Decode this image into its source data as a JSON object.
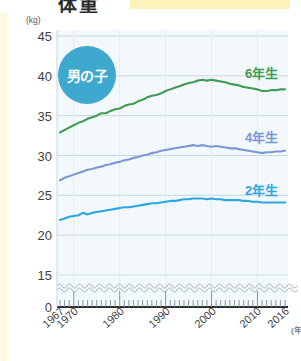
{
  "header": {
    "title_fragment": "体重",
    "highlight_present": true
  },
  "badge": {
    "label": "男の子",
    "color": "#3fa8ce"
  },
  "chart_data": {
    "type": "line",
    "xlabel": "(年)",
    "ylabel": "(kg)",
    "yunit": "(kg)",
    "xunit": "(年)",
    "grid": true,
    "legend_position": "inline-right",
    "axis_break": {
      "present": true,
      "between": [
        0,
        15
      ],
      "style": "wavy"
    },
    "ylim": [
      15,
      45
    ],
    "yticks": [
      0,
      15,
      20,
      25,
      30,
      35,
      40,
      45
    ],
    "xlim": [
      1967,
      2016
    ],
    "xticks": [
      1967,
      1970,
      1980,
      1990,
      2000,
      2010,
      2016
    ],
    "xtick_labels": [
      "1967",
      "1970",
      "1980",
      "1990",
      "2000",
      "2010",
      "2016"
    ],
    "x": [
      1967,
      1968,
      1969,
      1970,
      1971,
      1972,
      1973,
      1974,
      1975,
      1976,
      1977,
      1978,
      1979,
      1980,
      1981,
      1982,
      1983,
      1984,
      1985,
      1986,
      1987,
      1988,
      1989,
      1990,
      1991,
      1992,
      1993,
      1994,
      1995,
      1996,
      1997,
      1998,
      1999,
      2000,
      2001,
      2002,
      2003,
      2004,
      2005,
      2006,
      2007,
      2008,
      2009,
      2010,
      2011,
      2012,
      2013,
      2014,
      2015,
      2016
    ],
    "series": [
      {
        "name": "6年生",
        "label": "6年生",
        "color": "#3f9c52",
        "values": [
          32.9,
          33.2,
          33.5,
          33.8,
          34.1,
          34.3,
          34.6,
          34.8,
          35.0,
          35.3,
          35.3,
          35.6,
          35.8,
          35.9,
          36.2,
          36.4,
          36.5,
          36.8,
          37.0,
          37.3,
          37.5,
          37.6,
          37.8,
          38.1,
          38.3,
          38.5,
          38.7,
          38.9,
          39.1,
          39.2,
          39.4,
          39.5,
          39.4,
          39.5,
          39.4,
          39.3,
          39.2,
          39.0,
          38.9,
          38.8,
          38.6,
          38.5,
          38.4,
          38.3,
          38.1,
          38.1,
          38.2,
          38.2,
          38.3,
          38.3
        ]
      },
      {
        "name": "4年生",
        "label": "4年生",
        "color": "#7b96d4",
        "values": [
          26.9,
          27.2,
          27.4,
          27.6,
          27.8,
          28.0,
          28.2,
          28.3,
          28.5,
          28.6,
          28.8,
          28.9,
          29.1,
          29.2,
          29.4,
          29.5,
          29.7,
          29.8,
          30.0,
          30.1,
          30.3,
          30.4,
          30.6,
          30.7,
          30.8,
          30.9,
          31.0,
          31.1,
          31.2,
          31.3,
          31.2,
          31.3,
          31.2,
          31.1,
          31.2,
          31.1,
          31.0,
          30.9,
          30.9,
          30.8,
          30.7,
          30.6,
          30.5,
          30.4,
          30.3,
          30.4,
          30.4,
          30.5,
          30.5,
          30.6
        ]
      },
      {
        "name": "2年生",
        "label": "2年生",
        "color": "#2ba6e0",
        "values": [
          21.9,
          22.1,
          22.3,
          22.4,
          22.5,
          22.8,
          22.6,
          22.8,
          22.9,
          23.0,
          23.1,
          23.2,
          23.3,
          23.4,
          23.5,
          23.5,
          23.6,
          23.7,
          23.8,
          23.9,
          24.0,
          24.0,
          24.1,
          24.2,
          24.3,
          24.3,
          24.4,
          24.5,
          24.5,
          24.6,
          24.6,
          24.6,
          24.5,
          24.6,
          24.5,
          24.5,
          24.4,
          24.4,
          24.4,
          24.4,
          24.3,
          24.3,
          24.2,
          24.2,
          24.1,
          24.1,
          24.1,
          24.1,
          24.1,
          24.1
        ]
      }
    ]
  }
}
